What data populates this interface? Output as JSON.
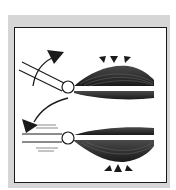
{
  "diagram": {
    "title": "",
    "colors": {
      "frame": "#d6d6d6",
      "panel_bg": "#ffffff",
      "border": "#1a1a1a",
      "muscle": "#2a2a2a",
      "motion_lines": "#8a8a8a"
    },
    "panels": [
      {
        "id": "flexion",
        "arrow_direction": "up",
        "contracted_muscle": "top",
        "indicator_icons": [
          "arrow-down-left-triangle",
          "arrow-down-triangle",
          "arrow-down-right-triangle"
        ]
      },
      {
        "id": "extension",
        "arrow_direction": "down",
        "contracted_muscle": "bottom",
        "indicator_icons": [
          "arrow-up-left-triangle",
          "arrow-up-triangle",
          "arrow-up-right-triangle"
        ]
      }
    ]
  }
}
